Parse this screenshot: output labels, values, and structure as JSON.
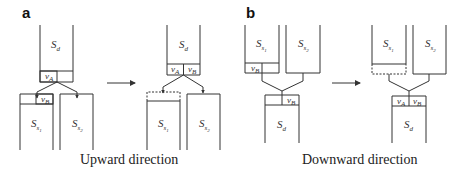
{
  "panels": {
    "a": {
      "label": "a",
      "caption": "Upward direction",
      "before": {
        "top_container": {
          "symbol": "S",
          "subscript": "d",
          "cells": [
            "v_A",
            ""
          ]
        },
        "left_container": {
          "symbol": "S",
          "subscript": "s1",
          "cells": [
            "",
            "v_B"
          ]
        },
        "right_container": {
          "symbol": "S",
          "subscript": "s2"
        }
      },
      "after": {
        "top_container": {
          "symbol": "S",
          "subscript": "d",
          "cells": [
            "v_A",
            "v_B"
          ]
        },
        "left_container": {
          "symbol": "S",
          "subscript": "s1",
          "cells_state": "empty (dashed)"
        },
        "right_container": {
          "symbol": "S",
          "subscript": "s2"
        }
      }
    },
    "b": {
      "label": "b",
      "caption": "Downward direction",
      "before": {
        "left_container": {
          "symbol": "S",
          "subscript": "s1",
          "cells": [
            "v_B",
            ""
          ]
        },
        "right_container": {
          "symbol": "S",
          "subscript": "s2"
        },
        "bottom_container": {
          "symbol": "S",
          "subscript": "d",
          "cells": [
            "",
            "v_B"
          ]
        }
      },
      "after": {
        "left_container": {
          "symbol": "S",
          "subscript": "s1",
          "cells_state": "empty (dashed)"
        },
        "right_container": {
          "symbol": "S",
          "subscript": "s2"
        },
        "bottom_container": {
          "symbol": "S",
          "subscript": "d",
          "cells": [
            "v_A",
            "v_B"
          ]
        }
      }
    }
  },
  "labels": {
    "a": "a",
    "b": "b",
    "caption_a": "Upward direction",
    "caption_b": "Downward direction",
    "S": "S",
    "d": "d",
    "s1": "s",
    "s1n": "1",
    "s2": "s",
    "s2n": "2",
    "v": "v",
    "A": "A",
    "B": "B"
  }
}
